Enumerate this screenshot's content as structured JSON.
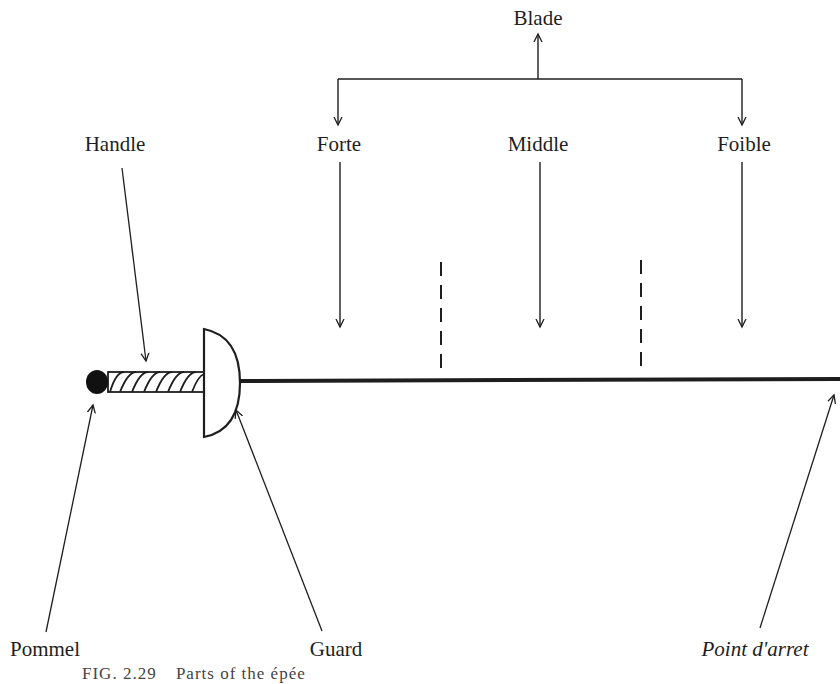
{
  "diagram": {
    "title": "Parts of the épée",
    "caption": {
      "figure_number": "FIG. 2.29",
      "text": "Parts of the épée"
    },
    "labels": {
      "blade": "Blade",
      "forte": "Forte",
      "middle": "Middle",
      "foible": "Foible",
      "handle": "Handle",
      "pommel": "Pommel",
      "guard": "Guard",
      "point_darret": "Point d'arret"
    },
    "structure": {
      "blade_sections": [
        "Forte",
        "Middle",
        "Foible"
      ],
      "components_left_to_right": [
        "Pommel",
        "Handle",
        "Guard",
        "Blade",
        "Point d'arret"
      ]
    },
    "colors": {
      "ink": "#1e1e1e",
      "background": "#ffffff"
    }
  }
}
